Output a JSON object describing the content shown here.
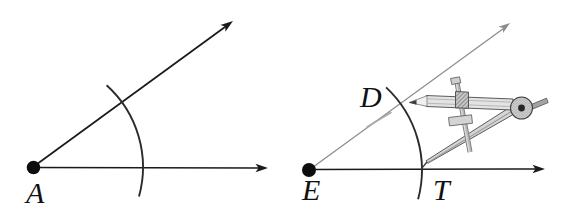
{
  "figure": {
    "type": "geometry-construction-diagram",
    "background_color": "#ffffff"
  },
  "colors": {
    "ink_black": "#1a1a1a",
    "gray_ray": "#8c8c8c",
    "arc_stroke": "#2b2b2b",
    "pencil_mark_gray": "#a8a8a8",
    "label_color": "#111111",
    "compass_metal_light": "#e3e3e3",
    "compass_metal_mid": "#c4c4c4",
    "compass_metal_dark": "#8f8f8f",
    "compass_outline": "#4a4a4a"
  },
  "left_diagram": {
    "vertex_label": "A"
  },
  "right_diagram": {
    "vertex_label": "E",
    "upper_intersection_label": "D",
    "baseline_intersection_label": "T"
  }
}
